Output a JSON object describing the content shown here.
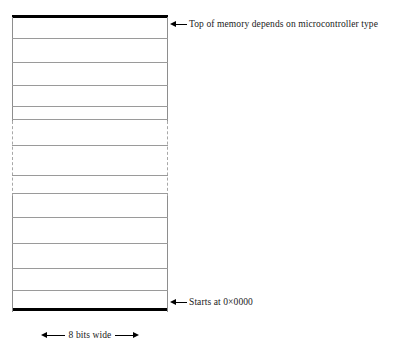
{
  "diagram": {
    "type": "memory-map",
    "column": {
      "cell_count": 12,
      "cell_divider_offsets": [
        23,
        47,
        70,
        91,
        104,
        130,
        160,
        178,
        202,
        228,
        253,
        275
      ],
      "elision": {
        "present": true,
        "style": "dashed",
        "start_offset": 106,
        "end_offset": 181,
        "meaning": "memory continues"
      },
      "cap_color": "#000000",
      "divider_color": "#9a9a9a",
      "edge_color": "#8e8e8e"
    },
    "annotations": {
      "top": {
        "label": "Top of memory depends on microcontroller type",
        "arrow": "arrow-left-icon"
      },
      "bottom": {
        "label": "Starts at 0×0000",
        "arrow": "arrow-left-icon"
      }
    },
    "dimension": {
      "label": "8 bits wide",
      "arrow_left": "arrow-left-icon",
      "arrow_right": "arrow-right-icon"
    }
  }
}
